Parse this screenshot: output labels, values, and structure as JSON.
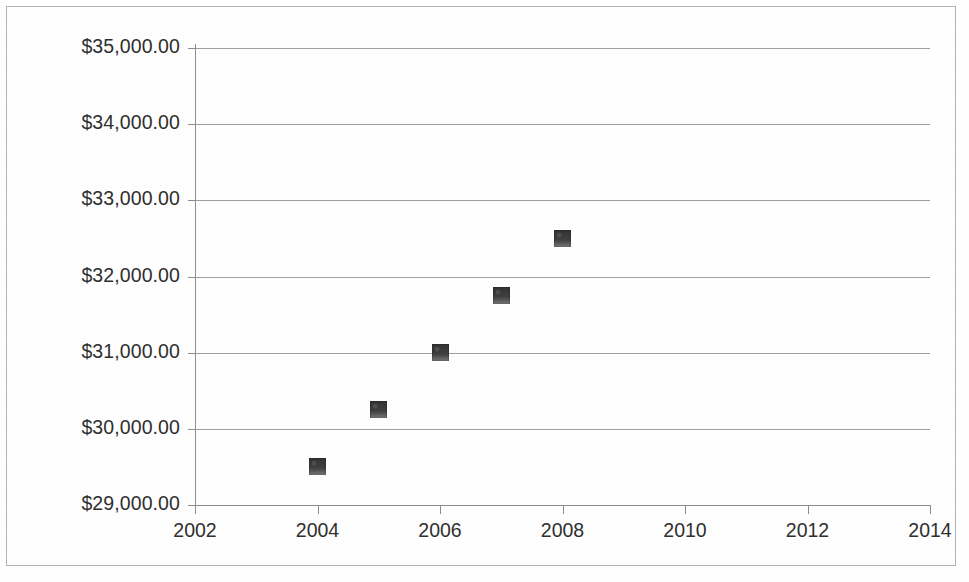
{
  "chart_data": {
    "type": "scatter",
    "title": "",
    "subtitle": "",
    "xlabel": "",
    "ylabel": "",
    "x": [
      2004,
      2005,
      2006,
      2007,
      2008
    ],
    "values": [
      29500.0,
      30250.0,
      31000.0,
      31750.0,
      32500.0
    ],
    "series": [
      {
        "name": "",
        "points": [
          {
            "x": 2004,
            "y": 29500.0
          },
          {
            "x": 2005,
            "y": 30250.0
          },
          {
            "x": 2006,
            "y": 31000.0
          },
          {
            "x": 2007,
            "y": 31750.0
          },
          {
            "x": 2008,
            "y": 32500.0
          }
        ]
      }
    ],
    "xlim": [
      2002,
      2014
    ],
    "ylim": [
      29000,
      35000
    ],
    "xticks": [
      2002,
      2004,
      2006,
      2008,
      2010,
      2012,
      2014
    ],
    "yticks": [
      29000,
      30000,
      31000,
      32000,
      33000,
      34000,
      35000
    ],
    "xtick_labels": [
      "2002",
      "2004",
      "2006",
      "2008",
      "2010",
      "2012",
      "2014"
    ],
    "ytick_labels": [
      "$29,000.00",
      "$30,000.00",
      "$31,000.00",
      "$32,000.00",
      "$33,000.00",
      "$34,000.00",
      "$35,000.00"
    ],
    "grid": true,
    "grid_axis": "y",
    "legend": false,
    "legend_position": "none",
    "marker_shape": "square",
    "marker_color": "#3b3b3b",
    "gridline_color": "#8d8d8d",
    "axis_color": "#8d8d8d",
    "background_color": "#ffffff",
    "text_color": "#2f2f2f"
  }
}
